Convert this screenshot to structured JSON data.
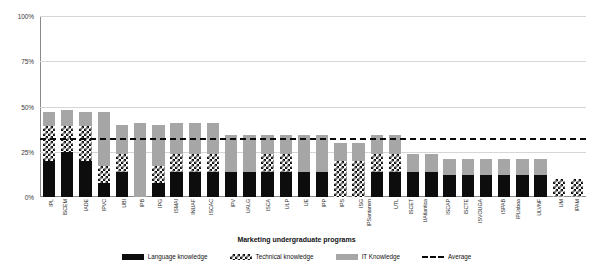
{
  "chart_data": {
    "type": "bar",
    "stacked": true,
    "title": "",
    "xlabel": "Marketing undergraduate programs",
    "ylabel": "% of agreement",
    "ylim": [
      0,
      100
    ],
    "yticks": [
      "0%",
      "25%",
      "50%",
      "75%",
      "100%"
    ],
    "ytick_values": [
      0,
      25,
      50,
      75,
      100
    ],
    "grid": true,
    "legend_position": "bottom",
    "categories": [
      "IPL",
      "ISCEM",
      "IADE",
      "IPVC",
      "UBI",
      "IPB",
      "IPG",
      "ISMAI",
      "INUAF",
      "ISCAC",
      "IPV",
      "UALG",
      "ISCA",
      "ULP",
      "UE",
      "IPP",
      "IPS",
      "ISG",
      "IPSantarem",
      "UTL",
      "ISCET",
      "UAtlantica",
      "ISCAP",
      "ISCTE",
      "ISVOUGA",
      "ISPAB",
      "IPLisboa",
      "ULVNF",
      "UM",
      "IPAM"
    ],
    "series": [
      {
        "name": "Language knowledge",
        "color": "#0d0d0d",
        "values": [
          20,
          25,
          20,
          8,
          14,
          0,
          8,
          14,
          14,
          14,
          14,
          14,
          14,
          14,
          14,
          14,
          0,
          0,
          14,
          14,
          14,
          14,
          12,
          12,
          12,
          12,
          12,
          12,
          0,
          0
        ]
      },
      {
        "name": "Technical knowledge",
        "color": "#ffffff",
        "pattern": "checkerboard",
        "values": [
          19,
          14,
          19,
          9,
          10,
          0,
          9,
          10,
          10,
          10,
          0,
          0,
          10,
          10,
          0,
          0,
          20,
          20,
          10,
          10,
          0,
          0,
          0,
          0,
          0,
          0,
          0,
          0,
          10,
          10
        ]
      },
      {
        "name": "IT Knowledge",
        "color": "#a6a6a6",
        "values": [
          8,
          9,
          8,
          30,
          16,
          41,
          23,
          17,
          17,
          17,
          20,
          20,
          10,
          10,
          20,
          20,
          10,
          10,
          10,
          10,
          10,
          10,
          9,
          9,
          9,
          9,
          9,
          9,
          0,
          0
        ]
      }
    ],
    "average": {
      "name": "Average",
      "value": 32.5,
      "color": "#0a0a0a",
      "style": "dashed"
    },
    "legend": [
      "Language knowledge",
      "Technical knowledge",
      "IT Knowledge",
      "Average"
    ]
  }
}
